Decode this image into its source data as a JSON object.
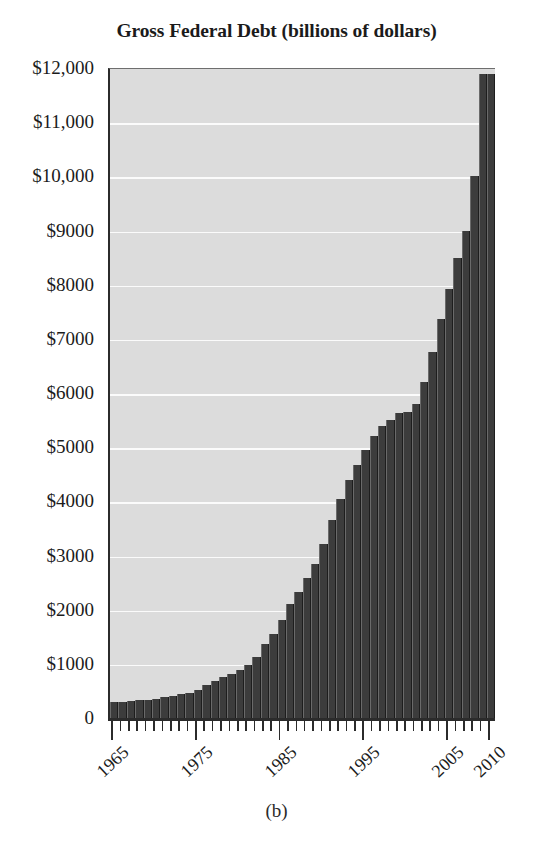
{
  "chart_data": {
    "type": "bar",
    "title": "Gross Federal Debt (billions of dollars)",
    "caption": "(b)",
    "xlabel": "",
    "ylabel": "",
    "ylim": [
      0,
      12000
    ],
    "grid": true,
    "legend": null,
    "y_ticks": [
      {
        "value": 12000,
        "label": "$12,000"
      },
      {
        "value": 11000,
        "label": "$11,000"
      },
      {
        "value": 10000,
        "label": "$10,000"
      },
      {
        "value": 9000,
        "label": "$9000"
      },
      {
        "value": 8000,
        "label": "$8000"
      },
      {
        "value": 7000,
        "label": "$7000"
      },
      {
        "value": 6000,
        "label": "$6000"
      },
      {
        "value": 5000,
        "label": "$5000"
      },
      {
        "value": 4000,
        "label": "$4000"
      },
      {
        "value": 3000,
        "label": "$3000"
      },
      {
        "value": 2000,
        "label": "$2000"
      },
      {
        "value": 1000,
        "label": "$1000"
      },
      {
        "value": 0,
        "label": "0"
      }
    ],
    "x_tick_labels": [
      "1965",
      "1975",
      "1985",
      "1995",
      "2005",
      "2010"
    ],
    "categories": [
      "1965",
      "1966",
      "1967",
      "1968",
      "1969",
      "1970",
      "1971",
      "1972",
      "1973",
      "1974",
      "1975",
      "1976",
      "1977",
      "1978",
      "1979",
      "1980",
      "1981",
      "1982",
      "1983",
      "1984",
      "1985",
      "1986",
      "1987",
      "1988",
      "1989",
      "1990",
      "1991",
      "1992",
      "1993",
      "1994",
      "1995",
      "1996",
      "1997",
      "1998",
      "1999",
      "2000",
      "2001",
      "2002",
      "2003",
      "2004",
      "2005",
      "2006",
      "2007",
      "2008",
      "2009",
      "2010"
    ],
    "values": [
      317,
      320,
      326,
      348,
      354,
      371,
      398,
      427,
      458,
      475,
      533,
      620,
      699,
      772,
      827,
      908,
      998,
      1142,
      1377,
      1572,
      1823,
      2125,
      2350,
      2602,
      2857,
      3233,
      3665,
      4065,
      4411,
      4693,
      4974,
      5225,
      5413,
      5526,
      5656,
      5674,
      5807,
      6228,
      6783,
      7379,
      7933,
      8507,
      9008,
      10025,
      11910,
      11900
    ],
    "bar_color": "#3c3c3c",
    "plot_background": "#dcdcdc",
    "gridline_color": "#fbfbfb",
    "axis_color": "#2b2b2b"
  }
}
